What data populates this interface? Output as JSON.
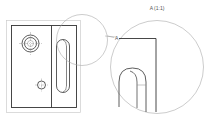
{
  "drawing": {
    "detail_callout_label": "A",
    "detail_view_title": "A (1:1)",
    "colors": {
      "outline": "#333333",
      "thin": "#aaaaaa",
      "frame": "#cccccc",
      "background": "#ffffff"
    }
  }
}
